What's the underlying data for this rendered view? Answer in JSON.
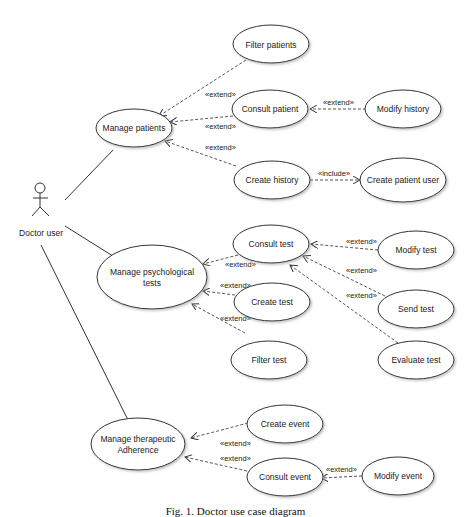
{
  "actor": {
    "label": "Doctor user"
  },
  "use_cases": {
    "manage_patients": "Manage patients",
    "filter_patients": "Filter patients",
    "consult_patient": "Consult patient",
    "modify_history": "Modify history",
    "create_history": "Create history",
    "create_patient_user": "Create patient user",
    "manage_tests_line1": "Manage psychological",
    "manage_tests_line2": "tests",
    "consult_test": "Consult test",
    "modify_test": "Modify test",
    "create_test": "Create test",
    "send_test": "Send test",
    "filter_test": "Filter test",
    "evaluate_test": "Evaluate test",
    "manage_adherence_line1": "Manage therapeutic",
    "manage_adherence_line2": "Adherence",
    "create_event": "Create event",
    "consult_event": "Consult event",
    "modify_event": "Modify event"
  },
  "stereotypes": {
    "extend": "«extend»",
    "include": "«include»"
  },
  "caption": "Fig. 1. Doctor use case diagram"
}
